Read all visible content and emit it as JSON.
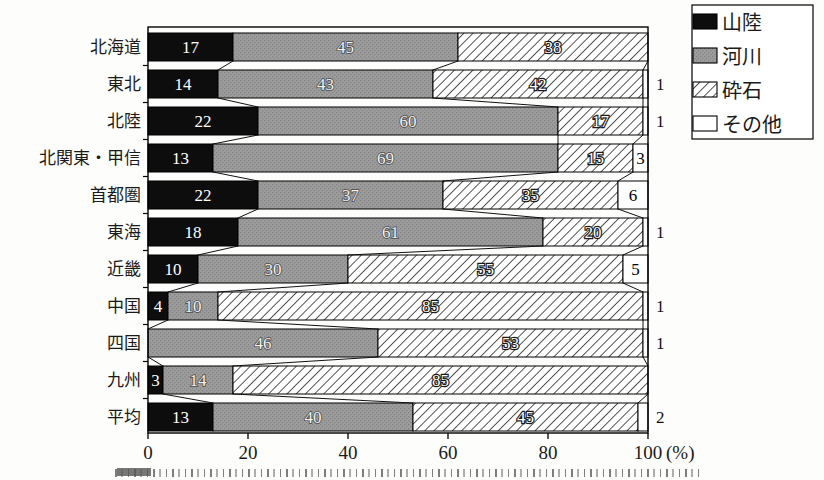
{
  "figure": {
    "unit_label": "(%)",
    "caption_note": "caption cropped at bottom edge of image"
  },
  "chart_data": {
    "type": "bar",
    "subtype": "horizontal-stacked-percentage",
    "title": "",
    "xlabel": "",
    "ylabel": "",
    "unit": "(%)",
    "xlim": [
      0,
      100
    ],
    "x_ticks": [
      0,
      20,
      40,
      60,
      80,
      100
    ],
    "grid": false,
    "legend_position": "top-right",
    "legend": [
      "山陸",
      "河川",
      "砕石",
      "その他"
    ],
    "categories": [
      "北海道",
      "東北",
      "北陸",
      "北関東・甲信",
      "首都圏",
      "東海",
      "近畿",
      "中国",
      "四国",
      "九州",
      "平均"
    ],
    "series": [
      {
        "name": "山陸",
        "values": [
          17,
          14,
          22,
          13,
          22,
          18,
          10,
          4,
          0,
          3,
          13
        ]
      },
      {
        "name": "河川",
        "values": [
          45,
          43,
          60,
          69,
          37,
          61,
          30,
          10,
          46,
          14,
          40
        ]
      },
      {
        "name": "砕石",
        "values": [
          38,
          42,
          17,
          15,
          35,
          20,
          55,
          85,
          53,
          85,
          45
        ]
      },
      {
        "name": "その他",
        "values": [
          0,
          1,
          1,
          3,
          6,
          1,
          5,
          1,
          1,
          0,
          2
        ]
      }
    ],
    "bar_width_overrides": {
      "九州": [
        3,
        14,
        83,
        0
      ]
    },
    "other_label_inside_min": 3,
    "colors": {
      "series_black": "#0d0d0d",
      "series_gray": "#9c9c9c",
      "series_gray_dot": "#848484",
      "hatch_bg": "#ffffff",
      "hatch_line": "#1c1c1c",
      "other_bg": "#ffffff",
      "frame": "#000000",
      "connector": "#111111",
      "background": "#fdfdfc"
    }
  }
}
